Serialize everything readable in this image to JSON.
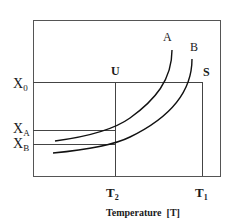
{
  "diagram": {
    "type": "phase-curve-diagram",
    "x_axis_title": "Temperature  [T]",
    "x_ticks": [
      {
        "main": "T",
        "sub": "2"
      },
      {
        "main": "T",
        "sub": "1"
      }
    ],
    "y_ticks": [
      {
        "main": "X",
        "sub": "0"
      },
      {
        "main": "X",
        "sub": "A"
      },
      {
        "main": "X",
        "sub": "B"
      }
    ],
    "curves": [
      {
        "label": "A"
      },
      {
        "label": "B"
      }
    ],
    "points": [
      {
        "label": "U"
      },
      {
        "label": "S"
      }
    ],
    "colors": {
      "line": "#333333",
      "curve": "#111111",
      "frame": "#555555"
    }
  }
}
